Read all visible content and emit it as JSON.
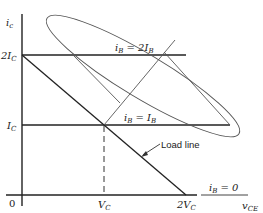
{
  "diagram": {
    "axes": {
      "y_label": "i",
      "y_label_sub": "c",
      "x_label": "v",
      "x_label_sub": "CE",
      "origin": "0"
    },
    "y_ticks": [
      {
        "label": "2I",
        "sub": "C"
      },
      {
        "label": "I",
        "sub": "C"
      }
    ],
    "x_ticks": [
      {
        "label": "V",
        "sub": "C"
      },
      {
        "label": "2V",
        "sub": "C"
      }
    ],
    "curves": [
      {
        "label": "i",
        "sub": "B",
        "eq": " = 2I",
        "eq_sub": "B"
      },
      {
        "label": "i",
        "sub": "B",
        "eq": " = I",
        "eq_sub": "B"
      },
      {
        "label": "i",
        "sub": "B",
        "eq": " = 0",
        "eq_sub": ""
      }
    ],
    "annotation": "Load line",
    "colors": {
      "line": "#222222",
      "thin": "#555555"
    }
  }
}
